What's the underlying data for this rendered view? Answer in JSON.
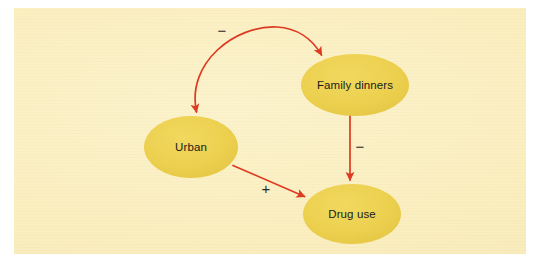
{
  "figure": {
    "kind": "causal-path-diagram",
    "background_color": "#ffffff",
    "panel_color": "#fbf0c4",
    "node_fill_color": "#ecd04f",
    "arrow_color": "#dd3a21",
    "label_text_color": "#1a1a1a"
  },
  "nodes": [
    {
      "id": "urban",
      "label": "Urban",
      "cx": 191,
      "cy": 147,
      "rx": 47,
      "ry": 31
    },
    {
      "id": "family-dinners",
      "label": "Family dinners",
      "cx": 355,
      "cy": 85,
      "rx": 54,
      "ry": 31
    },
    {
      "id": "drug-use",
      "label": "Drug use",
      "cx": 352,
      "cy": 214,
      "rx": 49,
      "ry": 30
    }
  ],
  "edges": [
    {
      "id": "urban-family-dinners",
      "from": "urban",
      "to": "family-dinners",
      "sign": "−",
      "sign_x": 222,
      "sign_y": 32,
      "style": "curved-double-headed",
      "description": "Urban and Family dinners negatively associated"
    },
    {
      "id": "family-dinners-drug-use",
      "from": "family-dinners",
      "to": "drug-use",
      "sign": "−",
      "sign_x": 360,
      "sign_y": 148,
      "style": "straight-vertical",
      "description": "Family dinners reduce Drug use"
    },
    {
      "id": "urban-drug-use",
      "from": "urban",
      "to": "drug-use",
      "sign": "+",
      "sign_x": 266,
      "sign_y": 190,
      "style": "straight-diagonal",
      "description": "Urban increases Drug use"
    }
  ]
}
